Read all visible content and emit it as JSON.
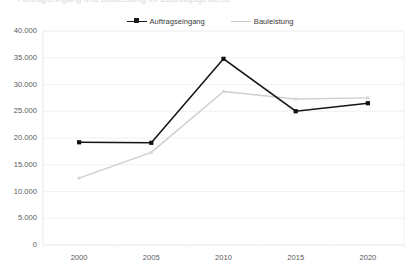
{
  "chart_data": {
    "type": "line",
    "title": "Auftragseingang und Bauleistung im Bauhauptgewerbe",
    "categories": [
      "2000",
      "2005",
      "2010",
      "2015",
      "2020"
    ],
    "series": [
      {
        "name": "Auftragseingang",
        "color": "#151515",
        "values": [
          19200,
          19100,
          34800,
          25000,
          26500
        ]
      },
      {
        "name": "Bauleistung",
        "color": "#cfcfcf",
        "values": [
          12500,
          17300,
          28700,
          27300,
          27500
        ]
      }
    ],
    "xlabel": "",
    "ylabel": "",
    "ylim": [
      0,
      40000
    ],
    "ytick_labels": [
      "0",
      "5.000",
      "10.000",
      "15.000",
      "20.000",
      "25.000",
      "30.000",
      "35.000",
      "40.000"
    ],
    "ytick_values": [
      0,
      5000,
      10000,
      15000,
      20000,
      25000,
      30000,
      35000,
      40000
    ],
    "grid": true,
    "legend_position": "top-center"
  }
}
